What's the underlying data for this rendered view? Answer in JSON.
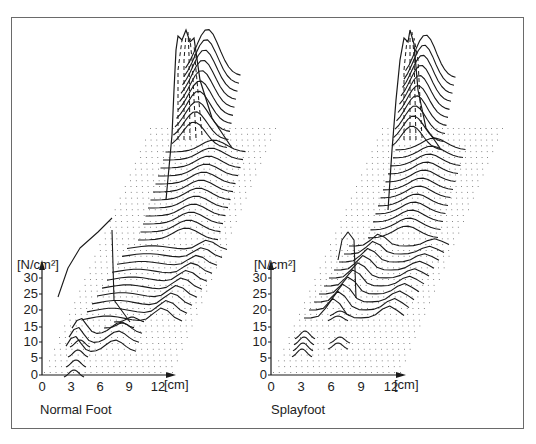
{
  "chart_data": [
    {
      "type": "surface-3d-waterfall",
      "title": "Normal Foot",
      "xlabel": "[cm]",
      "ylabel": "[N/cm²]",
      "x_ticks": [
        "0",
        "3",
        "6",
        "9",
        "12"
      ],
      "y_ticks": [
        "0",
        "5",
        "10",
        "15",
        "20",
        "25",
        "30"
      ],
      "xlim": [
        0,
        12
      ],
      "ylim": [
        0,
        30
      ],
      "grid": "dotted base plane",
      "description": "Plantar pressure distribution; peaks at heel (~30+ N/cm², off-scale), moderate midfoot-lateral ridge, forefoot peaks at metatarsal 1 and lateral metatarsals around 8-10 N/cm², toes ~5 N/cm²",
      "regions": [
        {
          "name": "heel",
          "peak_pressure": 45
        },
        {
          "name": "lateral midfoot",
          "peak_pressure": 12
        },
        {
          "name": "forefoot medial (MT1)",
          "peak_pressure": 20
        },
        {
          "name": "forefoot lateral",
          "peak_pressure": 10
        },
        {
          "name": "hallux",
          "peak_pressure": 8
        },
        {
          "name": "lesser toes",
          "peak_pressure": 5
        }
      ]
    },
    {
      "type": "surface-3d-waterfall",
      "title": "Splayfoot",
      "xlabel": "[cm]",
      "ylabel": "[N/cm²]",
      "x_ticks": [
        "0",
        "3",
        "6",
        "9",
        "12"
      ],
      "y_ticks": [
        "0",
        "5",
        "10",
        "15",
        "20",
        "25",
        "30"
      ],
      "xlim": [
        0,
        12
      ],
      "ylim": [
        0,
        30
      ],
      "grid": "dotted base plane",
      "description": "Plantar pressure distribution; heel peak off-scale, central metatarsal peak (~20 N/cm²) indicating splayfoot load shift, toes ~5 N/cm²",
      "regions": [
        {
          "name": "heel",
          "peak_pressure": 45
        },
        {
          "name": "lateral midfoot",
          "peak_pressure": 12
        },
        {
          "name": "forefoot central (MT2-3)",
          "peak_pressure": 22
        },
        {
          "name": "hallux",
          "peak_pressure": 8
        },
        {
          "name": "lesser toes",
          "peak_pressure": 6
        }
      ]
    }
  ],
  "plots": [
    {
      "caption": "Normal Foot",
      "y_unit": "[N/cm²]",
      "x_unit": "[cm]",
      "y_ticks": [
        "30",
        "25",
        "20",
        "15",
        "10",
        "5",
        "0"
      ],
      "x_ticks": [
        "0",
        "3",
        "6",
        "9",
        "12"
      ]
    },
    {
      "caption": "Splayfoot",
      "y_unit": "[N/cm²]",
      "x_unit": "[cm]",
      "y_ticks": [
        "30",
        "25",
        "20",
        "15",
        "10",
        "5",
        "0"
      ],
      "x_ticks": [
        "0",
        "3",
        "6",
        "9",
        "12"
      ]
    }
  ],
  "colors": {
    "ink": "#1a1a1a",
    "dots": "#6b6b6b",
    "frame": "#6a6a6a"
  }
}
